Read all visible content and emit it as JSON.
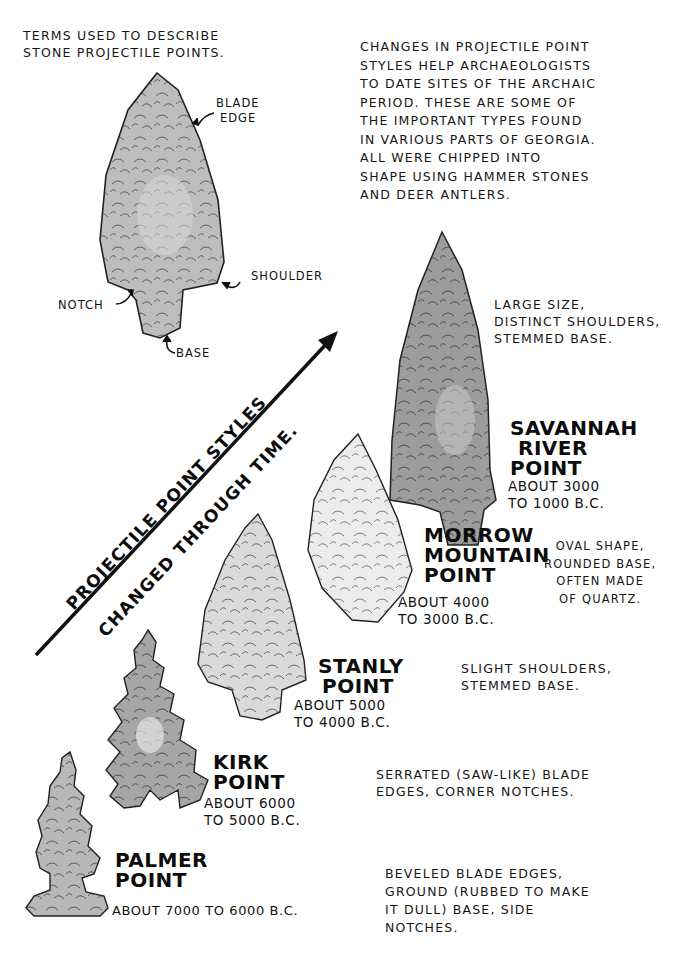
{
  "intro": {
    "title_lines": [
      "Terms used to describe",
      "stone projectile points."
    ],
    "description_lines": [
      "Changes in projectile point",
      "styles help archaeologists",
      "to date sites of the Archaic",
      "Period. These are some of",
      "the important types found",
      "in various parts of Georgia.",
      "All were chipped into",
      "shape using hammer stones",
      "and deer antlers."
    ]
  },
  "anatomy": {
    "labels": {
      "blade_edge": [
        "Blade",
        "Edge"
      ],
      "shoulder": "Shoulder",
      "notch": "Notch",
      "base": "Base"
    }
  },
  "timeline_arrow": {
    "line1": "Projectile point styles",
    "line2": "changed through time."
  },
  "points": [
    {
      "name_lines": [
        "Savannah",
        "River",
        "Point"
      ],
      "date_lines": [
        "About 3000",
        "to 1000 B.C."
      ],
      "description_lines": [
        "Large size,",
        "distinct shoulders,",
        "stemmed base."
      ],
      "color": "#9a9a9a"
    },
    {
      "name_lines": [
        "Morrow",
        "Mountain",
        "Point"
      ],
      "date_lines": [
        "About 4000",
        "to 3000 B.C."
      ],
      "description_lines": [
        "Oval shape,",
        "rounded base,",
        "often made",
        "of quartz."
      ],
      "color": "#e8e8e8"
    },
    {
      "name_lines": [
        "Stanly",
        "Point"
      ],
      "date_lines": [
        "About 5000",
        "to 4000 B.C."
      ],
      "description_lines": [
        "Slight shoulders,",
        "stemmed base."
      ],
      "color": "#d6d6d6"
    },
    {
      "name_lines": [
        "Kirk",
        "Point"
      ],
      "date_lines": [
        "About 6000",
        "to 5000 B.C."
      ],
      "description_lines": [
        "Serrated (saw-like) blade",
        "edges, corner notches."
      ],
      "color": "#a8a8a8"
    },
    {
      "name_lines": [
        "Palmer",
        "Point"
      ],
      "date_lines": [
        "About 7000 to 6000 B.C."
      ],
      "description_lines": [
        "Beveled blade edges,",
        "ground (rubbed to make",
        "it dull) base, side",
        "notches."
      ],
      "color": "#b4b4b4"
    }
  ]
}
